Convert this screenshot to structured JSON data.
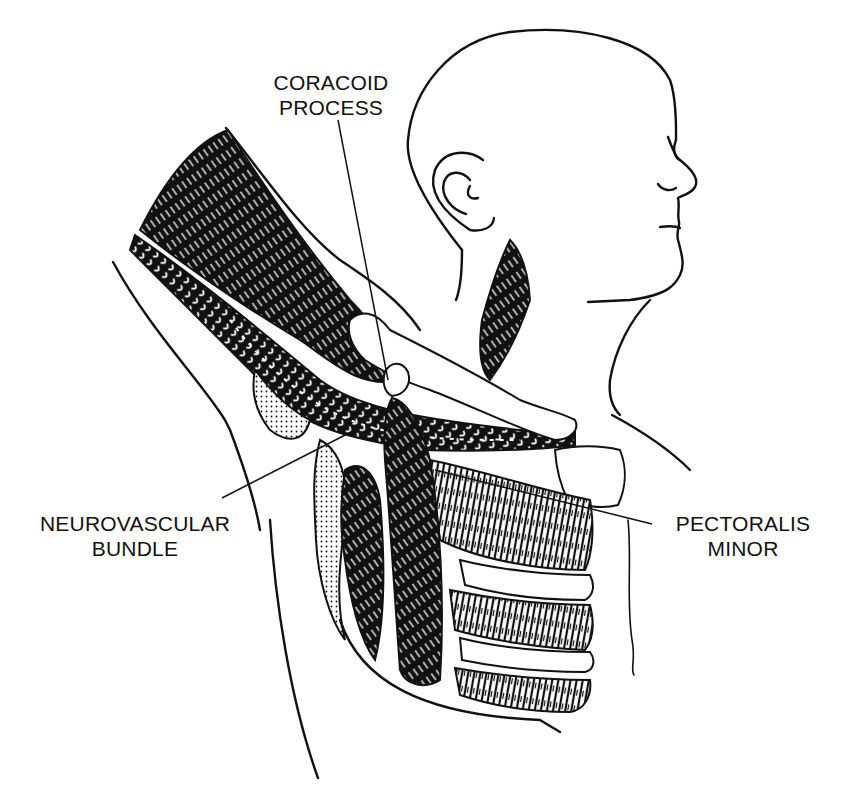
{
  "figure": {
    "style": "black-and-white pen illustration",
    "colors": {
      "ink": "#111111",
      "background": "#ffffff"
    }
  },
  "labels": {
    "coracoid": {
      "line1": "CORACOID",
      "line2": "PROCESS"
    },
    "neurovascular": {
      "line1": "NEUROVASCULAR",
      "line2": "BUNDLE"
    },
    "pectoralis": {
      "line1": "PECTORALIS",
      "line2": "MINOR"
    }
  }
}
